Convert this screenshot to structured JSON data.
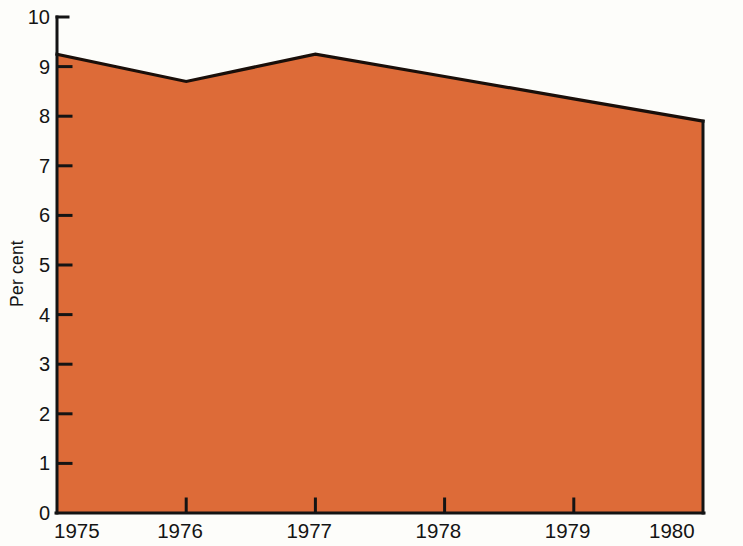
{
  "chart_data": {
    "type": "area",
    "title": "",
    "subtitle": "",
    "xlabel": "",
    "ylabel": "Per cent",
    "x": [
      1975,
      1976,
      1977,
      1978,
      1979,
      1980
    ],
    "categories": [
      "1975",
      "1976",
      "1977",
      "1978",
      "1979",
      "1980"
    ],
    "values": [
      9.25,
      8.7,
      9.25,
      8.8,
      8.35,
      7.9
    ],
    "series": [
      {
        "name": "Per cent",
        "values": [
          9.25,
          8.7,
          9.25,
          8.8,
          8.35,
          7.9
        ]
      }
    ],
    "xlim": [
      1975,
      1980
    ],
    "ylim": [
      0,
      10
    ],
    "ytick_values": [
      0,
      1,
      2,
      3,
      4,
      5,
      6,
      7,
      8,
      9,
      10
    ],
    "ytick_labels": [
      "0",
      "1",
      "2",
      "3",
      "4",
      "5",
      "6",
      "7",
      "8",
      "9",
      "10"
    ],
    "xtick_labels": [
      "1975",
      "1976",
      "1977",
      "1978",
      "1979",
      "1980"
    ],
    "grid": false,
    "legend": false,
    "legend_position": "none",
    "annotations": [],
    "fill_color": "#dd6b38",
    "line_color": "#1a0f0a",
    "axis_color": "#141414",
    "background_color": "#fdfdfa",
    "vertex_years": [
      "1975",
      "1976",
      "1977",
      "1980"
    ],
    "vertex_values": [
      9.25,
      8.7,
      9.25,
      7.9
    ]
  },
  "geometry": {
    "plot_left": 57,
    "plot_right": 703,
    "plot_top": 17,
    "plot_bottom": 513,
    "y_max": 10,
    "y_min": 0,
    "x_tick_pixels": [
      57,
      186,
      317,
      446,
      574,
      703
    ],
    "y_tick_pixels": [
      513,
      463,
      414,
      364,
      315,
      265,
      215,
      166,
      116,
      67,
      17
    ]
  }
}
